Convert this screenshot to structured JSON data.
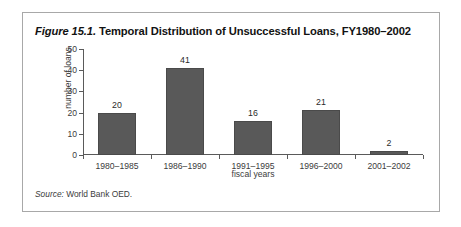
{
  "figure": {
    "number_label": "Figure 15.1.",
    "title_rest": " Temporal Distribution of Unsuccessful Loans, FY1980–2002",
    "source_label": "Source:",
    "source_rest": " World Bank OED."
  },
  "chart_data": {
    "type": "bar",
    "title": "Figure 15.1. Temporal Distribution of Unsuccessful Loans, FY1980–2002",
    "categories": [
      "1980–1985",
      "1986–1990",
      "1991–1995",
      "1996–2000",
      "2001–2002"
    ],
    "values": [
      20,
      41,
      16,
      21,
      2
    ],
    "xlabel": "fiscal years",
    "ylabel": "number of loans",
    "ylim": [
      0,
      50
    ],
    "yticks": [
      0,
      10,
      20,
      30,
      40,
      50
    ],
    "ytick_labels": [
      "0",
      "10",
      "20",
      "30",
      "40",
      "50"
    ],
    "value_labels": [
      "20",
      "41",
      "16",
      "21",
      "2"
    ],
    "grid": false,
    "legend": null,
    "bar_color": "#595959",
    "source": "Source: World Bank OED."
  }
}
